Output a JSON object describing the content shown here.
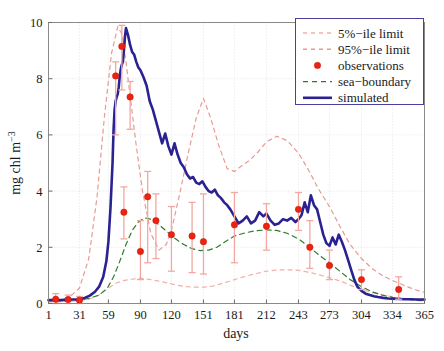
{
  "chart_data": {
    "type": "line",
    "title": "",
    "xlabel": "days",
    "ylabel": "mg chl m−3",
    "xlim": [
      1,
      365
    ],
    "ylim": [
      0,
      10
    ],
    "grid": true,
    "xticks": [
      1,
      31,
      59,
      90,
      120,
      151,
      181,
      212,
      243,
      273,
      304,
      334,
      365
    ],
    "xtick_labels": [
      "1",
      "31",
      "59",
      "90",
      "120",
      "151",
      "181",
      "212",
      "243",
      "273",
      "304",
      "334",
      "365"
    ],
    "yticks": [
      0,
      2,
      4,
      6,
      8,
      10
    ],
    "ytick_labels": [
      "0",
      "2",
      "4",
      "6",
      "8",
      "10"
    ],
    "legend_position": "top-right",
    "legend_entries": [
      {
        "label": "5%−ile limit",
        "style": "dashed",
        "color": "#f2b0a8"
      },
      {
        "label": "95%−ile limit",
        "style": "dashed",
        "color": "#e89a94"
      },
      {
        "label": "observations",
        "style": "marker",
        "color": "#ee2211"
      },
      {
        "label": "sea−boundary",
        "style": "dashed",
        "color": "#2f7a2f"
      },
      {
        "label": "simulated",
        "style": "solid",
        "color": "#2b2292"
      }
    ],
    "series": [
      {
        "name": "5%−ile limit",
        "style": "dashed",
        "color": "#f2b0a8",
        "x": [
          1,
          10,
          20,
          31,
          40,
          50,
          59,
          66,
          72,
          78,
          85,
          90,
          100,
          110,
          120,
          130,
          140,
          151,
          160,
          170,
          181,
          190,
          200,
          212,
          225,
          235,
          243,
          255,
          265,
          273,
          285,
          295,
          304,
          315,
          325,
          334,
          345,
          355,
          365
        ],
        "y": [
          0.05,
          0.06,
          0.08,
          0.1,
          0.15,
          0.3,
          0.55,
          0.72,
          0.8,
          0.85,
          0.88,
          0.9,
          0.85,
          0.78,
          0.7,
          0.62,
          0.58,
          0.58,
          0.62,
          0.72,
          0.85,
          0.95,
          1.05,
          1.15,
          1.2,
          1.2,
          1.18,
          1.1,
          1.0,
          0.92,
          0.78,
          0.62,
          0.5,
          0.38,
          0.3,
          0.24,
          0.18,
          0.14,
          0.1
        ]
      },
      {
        "name": "95%−ile limit",
        "style": "dashed",
        "color": "#e89a94",
        "x": [
          1,
          12,
          22,
          31,
          40,
          48,
          55,
          62,
          68,
          72,
          76,
          80,
          86,
          92,
          100,
          108,
          115,
          120,
          128,
          136,
          144,
          151,
          158,
          166,
          174,
          181,
          188,
          196,
          204,
          212,
          222,
          232,
          243,
          252,
          262,
          273,
          283,
          293,
          304,
          314,
          324,
          334,
          345,
          355,
          365
        ],
        "y": [
          0.1,
          0.12,
          0.25,
          0.55,
          1.6,
          3.8,
          6.6,
          8.9,
          9.85,
          9.6,
          8.6,
          7.4,
          5.6,
          4.0,
          2.5,
          1.9,
          2.1,
          2.6,
          3.9,
          5.3,
          6.6,
          7.3,
          6.6,
          5.6,
          4.8,
          4.7,
          4.9,
          5.1,
          5.4,
          5.75,
          5.95,
          5.8,
          5.35,
          4.8,
          4.1,
          3.45,
          2.75,
          2.1,
          1.6,
          1.25,
          1.0,
          0.82,
          0.65,
          0.5,
          0.4
        ]
      },
      {
        "name": "sea−boundary",
        "style": "dashed",
        "color": "#2f7a2f",
        "x": [
          1,
          12,
          22,
          31,
          40,
          50,
          58,
          64,
          70,
          76,
          82,
          88,
          94,
          100,
          108,
          116,
          124,
          132,
          140,
          148,
          156,
          164,
          172,
          181,
          190,
          200,
          212,
          222,
          232,
          243,
          252,
          262,
          273,
          283,
          293,
          304,
          314,
          324,
          334,
          345,
          355,
          365
        ],
        "y": [
          0.1,
          0.1,
          0.1,
          0.12,
          0.18,
          0.3,
          0.55,
          0.95,
          1.5,
          2.1,
          2.6,
          2.9,
          3.05,
          3.0,
          2.8,
          2.55,
          2.3,
          2.1,
          1.95,
          1.88,
          1.9,
          2.0,
          2.2,
          2.4,
          2.5,
          2.58,
          2.62,
          2.6,
          2.5,
          2.3,
          2.05,
          1.75,
          1.45,
          1.15,
          0.85,
          0.6,
          0.42,
          0.3,
          0.22,
          0.16,
          0.12,
          0.1
        ]
      },
      {
        "name": "simulated",
        "style": "solid",
        "color": "#2b2292",
        "x": [
          1,
          6,
          12,
          18,
          24,
          31,
          36,
          41,
          46,
          50,
          54,
          57,
          59,
          61,
          63,
          64,
          65,
          66,
          67,
          68,
          69,
          70,
          71,
          72,
          73,
          74,
          75,
          76,
          78,
          80,
          82,
          84,
          86,
          88,
          90,
          93,
          96,
          99,
          102,
          105,
          108,
          111,
          114,
          117,
          120,
          123,
          126,
          129,
          132,
          135,
          138,
          141,
          144,
          147,
          150,
          153,
          156,
          159,
          162,
          165,
          168,
          171,
          174,
          177,
          181,
          185,
          189,
          193,
          197,
          201,
          205,
          209,
          212,
          216,
          220,
          224,
          228,
          232,
          236,
          240,
          243,
          246,
          249,
          252,
          255,
          258,
          261,
          264,
          267,
          270,
          273,
          276,
          279,
          282,
          285,
          288,
          291,
          294,
          297,
          300,
          304,
          308,
          312,
          316,
          320,
          325,
          330,
          334,
          340,
          346,
          352,
          358,
          365
        ],
        "y": [
          0.12,
          0.12,
          0.12,
          0.13,
          0.14,
          0.15,
          0.2,
          0.28,
          0.42,
          0.6,
          0.95,
          1.5,
          2.2,
          3.4,
          5.0,
          6.2,
          6.9,
          7.2,
          7.35,
          7.45,
          7.7,
          8.1,
          8.35,
          8.5,
          8.6,
          9.0,
          9.5,
          9.8,
          9.55,
          9.2,
          8.95,
          8.85,
          8.6,
          8.4,
          8.3,
          8.05,
          7.75,
          7.2,
          6.9,
          6.5,
          6.1,
          5.7,
          6.05,
          5.6,
          5.3,
          5.7,
          5.3,
          5.0,
          4.85,
          4.6,
          4.45,
          4.5,
          4.3,
          4.25,
          4.35,
          4.15,
          4.0,
          3.95,
          4.05,
          3.85,
          3.75,
          3.6,
          3.5,
          3.35,
          3.1,
          2.85,
          2.95,
          3.1,
          2.85,
          2.95,
          3.25,
          3.1,
          3.2,
          2.95,
          2.8,
          2.85,
          3.0,
          2.95,
          3.05,
          2.9,
          3.0,
          3.15,
          3.6,
          3.25,
          3.85,
          3.5,
          3.35,
          2.9,
          2.45,
          2.15,
          2.05,
          2.35,
          2.1,
          2.45,
          2.2,
          1.9,
          1.55,
          1.2,
          0.85,
          0.6,
          0.45,
          0.35,
          0.3,
          0.26,
          0.23,
          0.2,
          0.18,
          0.17,
          0.16,
          0.15,
          0.15,
          0.14,
          0.14
        ]
      }
    ],
    "observations": [
      {
        "x": 8,
        "y": 0.15,
        "err_low": 0.0,
        "err_high": 0.35
      },
      {
        "x": 20,
        "y": 0.14,
        "err_low": 0.0,
        "err_high": 0.3
      },
      {
        "x": 31,
        "y": 0.12,
        "err_low": 0.0,
        "err_high": 0.25
      },
      {
        "x": 66,
        "y": 8.1,
        "err_low": 6.0,
        "err_high": 8.6
      },
      {
        "x": 72,
        "y": 9.15,
        "err_low": 7.6,
        "err_high": 9.9
      },
      {
        "x": 80,
        "y": 7.35,
        "err_low": 6.2,
        "err_high": 7.9
      },
      {
        "x": 74,
        "y": 3.25,
        "err_low": 2.3,
        "err_high": 4.15
      },
      {
        "x": 90,
        "y": 1.85,
        "err_low": 0.85,
        "err_high": 2.95
      },
      {
        "x": 97,
        "y": 3.8,
        "err_low": 1.45,
        "err_high": 4.7
      },
      {
        "x": 105,
        "y": 2.95,
        "err_low": 1.6,
        "err_high": 3.9
      },
      {
        "x": 120,
        "y": 2.45,
        "err_low": 1.15,
        "err_high": 3.45
      },
      {
        "x": 140,
        "y": 2.4,
        "err_low": 1.1,
        "err_high": 3.6
      },
      {
        "x": 151,
        "y": 2.2,
        "err_low": 1.05,
        "err_high": 3.9
      },
      {
        "x": 181,
        "y": 2.8,
        "err_low": 1.45,
        "err_high": 3.95
      },
      {
        "x": 212,
        "y": 2.75,
        "err_low": 1.9,
        "err_high": 3.55
      },
      {
        "x": 243,
        "y": 3.35,
        "err_low": 2.6,
        "err_high": 3.95
      },
      {
        "x": 254,
        "y": 2.0,
        "err_low": 1.25,
        "err_high": 2.95
      },
      {
        "x": 273,
        "y": 1.35,
        "err_low": 0.85,
        "err_high": 1.9
      },
      {
        "x": 304,
        "y": 0.85,
        "err_low": 0.5,
        "err_high": 1.2
      },
      {
        "x": 340,
        "y": 0.5,
        "err_low": 0.15,
        "err_high": 0.95
      }
    ]
  },
  "axis": {
    "xlabel": "days",
    "ylabel_main": "mg chl m",
    "ylabel_exp": "−3"
  }
}
